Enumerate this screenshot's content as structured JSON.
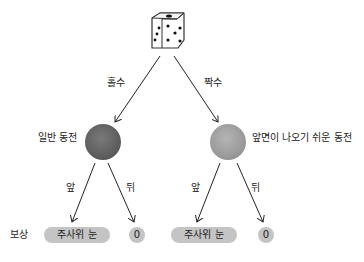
{
  "diagram": {
    "root": {
      "icon": "dice-icon"
    },
    "branches": [
      {
        "edge_label": "홀수",
        "node_label": "일반 동전",
        "coin_type": "normal",
        "coin_color": "#5e5e5e",
        "children": [
          {
            "edge_label": "앞",
            "reward": "주사위 눈"
          },
          {
            "edge_label": "뒤",
            "reward": "0"
          }
        ]
      },
      {
        "edge_label": "짝수",
        "node_label": "앞면이 나오기 쉬운 동전",
        "coin_type": "biased",
        "coin_color": "#9a9a9a",
        "children": [
          {
            "edge_label": "앞",
            "reward": "주사위 눈"
          },
          {
            "edge_label": "뒤",
            "reward": "0"
          }
        ]
      }
    ],
    "reward_row_label": "보상",
    "pill_color": "#c4c4c4"
  }
}
